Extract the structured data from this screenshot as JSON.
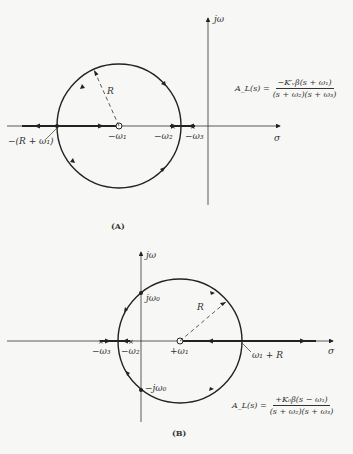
{
  "figure_a": {
    "caption": "(A)",
    "axis_x_label": "σ",
    "axis_y_label": "jω",
    "radius_label": "R",
    "points": {
      "zero": "−ω₁",
      "pole2": "−ω₂",
      "pole3": "−ω₃",
      "breakin": "−(R + ω₁)"
    },
    "transfer_function": {
      "lhs": "A_L(s) =",
      "numerator": "−K′ᵥβ(s + ω₁)",
      "denominator": "(s + ω₂)(s + ω₃)"
    }
  },
  "figure_b": {
    "caption": "(B)",
    "axis_x_label": "σ",
    "axis_y_label": "jω",
    "radius_label": "R",
    "points": {
      "zero": "+ω₁",
      "pole2": "−ω₂",
      "pole3": "−ω₃",
      "crossing_up": "jω₀",
      "crossing_down": "−jω₀",
      "breakin": "ω₁ + R"
    },
    "transfer_function": {
      "lhs": "A_L(s) =",
      "numerator": "+K₀β(s − ω₁)",
      "denominator": "(s + ω₂)(s + ω₃)"
    }
  }
}
